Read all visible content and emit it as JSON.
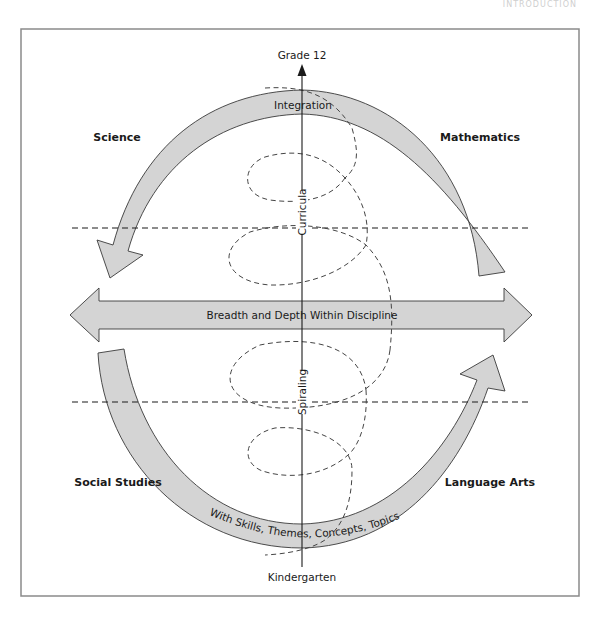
{
  "header": {
    "running_head": "INTRODUCTION"
  },
  "diagram": {
    "axis": {
      "top_label": "Grade 12",
      "bottom_label": "Kindergarten",
      "upper_vertical_label": "Curricula",
      "lower_vertical_label": "Spiraling"
    },
    "arcs": {
      "top_label": "Integration",
      "bottom_label": "With Skills, Themes, Concepts, Topics"
    },
    "horizontal_arrow": {
      "label": "Breadth and Depth Within Discipline"
    },
    "quadrants": {
      "top_left": "Science",
      "top_right": "Mathematics",
      "bottom_left": "Social Studies",
      "bottom_right": "Language Arts"
    },
    "colors": {
      "arrow_fill": "#d4d4d4",
      "stroke": "#3a3a3a",
      "frame": "#8a8a8a",
      "text": "#1a1a1a"
    }
  }
}
